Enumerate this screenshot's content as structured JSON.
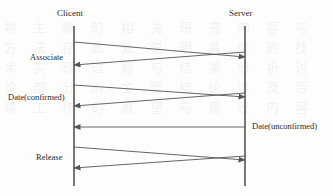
{
  "diagram": {
    "type": "sequence-diagram",
    "background_color": "#fdfdfc",
    "line_color": "#55555a",
    "text_color": "#2b2b2b",
    "participants": [
      {
        "id": "client",
        "label": "Clicent",
        "x": 74,
        "label_x": 57,
        "label_y": 8
      },
      {
        "id": "server",
        "label": "Server",
        "x": 245,
        "label_x": 229,
        "label_y": 8
      }
    ],
    "lifelines": {
      "top": 26,
      "bottom": 186
    },
    "messages": [
      {
        "id": "associate-request",
        "label": "Associate",
        "label_x": 30,
        "label_y": 52,
        "direction": "client-to-server",
        "x1": 74,
        "y1": 42,
        "x2": 245,
        "y2": 57
      },
      {
        "id": "associate-response",
        "label": "",
        "direction": "server-to-client",
        "x1": 245,
        "y1": 52,
        "x2": 74,
        "y2": 65
      },
      {
        "id": "date-confirmed-request",
        "label": "Date(confirmed)",
        "label_x": 8,
        "label_y": 92,
        "direction": "client-to-server",
        "x1": 74,
        "y1": 85,
        "x2": 245,
        "y2": 97
      },
      {
        "id": "date-confirmed-response",
        "label": "",
        "direction": "server-to-client",
        "x1": 245,
        "y1": 93,
        "x2": 74,
        "y2": 106
      },
      {
        "id": "date-unconfirmed",
        "label": "Date(unconfirmed)",
        "label_x": 252,
        "label_y": 121,
        "direction": "server-to-client",
        "x1": 245,
        "y1": 127,
        "x2": 74,
        "y2": 127
      },
      {
        "id": "release-request",
        "label": "Release",
        "label_x": 36,
        "label_y": 152,
        "direction": "client-to-server",
        "x1": 74,
        "y1": 147,
        "x2": 245,
        "y2": 160
      },
      {
        "id": "release-response",
        "label": "",
        "direction": "server-to-client",
        "x1": 245,
        "y1": 156,
        "x2": 74,
        "y2": 168
      }
    ],
    "bleed_text": "地 主 题 的 相 关 研 究 内 容 与 方 法 在 此 处 说 明 具 体 的 技 术 实 现 过 程 与 结 果 分 析 讨 论 部 分 的 主 要 结 论 以 及 后 续 工 作 的 展 望 与 建 议 内 容"
  }
}
